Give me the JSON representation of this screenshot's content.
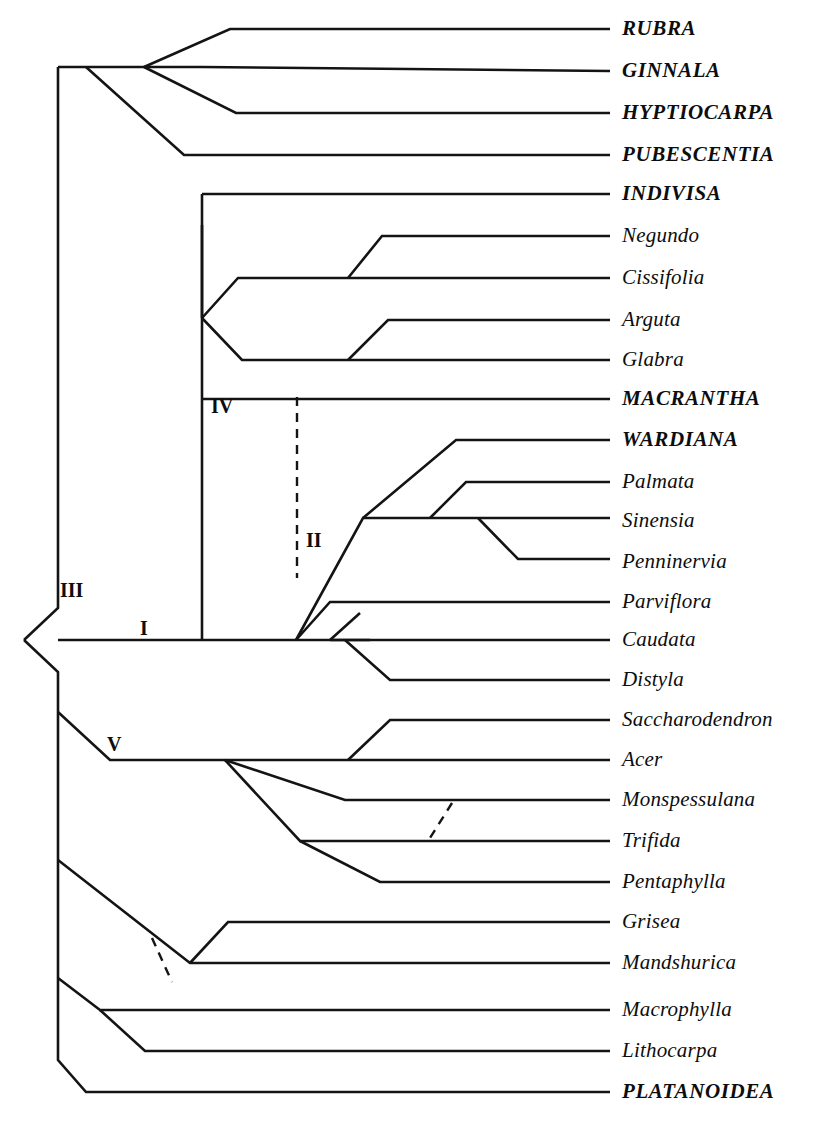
{
  "figure": {
    "kind": "cladogram",
    "title": "",
    "background_color": "#ffffff",
    "line_color": "#141414"
  },
  "tips": [
    {
      "label": "RUBRA",
      "style": "caps",
      "y": 29
    },
    {
      "label": "GINNALA",
      "style": "caps",
      "y": 71
    },
    {
      "label": "HYPTIOCARPA",
      "style": "caps",
      "y": 113
    },
    {
      "label": "PUBESCENTIA",
      "style": "caps",
      "y": 155
    },
    {
      "label": "INDIVISA",
      "style": "caps",
      "y": 194
    },
    {
      "label": "Negundo",
      "style": "lower",
      "y": 236
    },
    {
      "label": "Cissifolia",
      "style": "lower",
      "y": 278
    },
    {
      "label": "Arguta",
      "style": "lower",
      "y": 320
    },
    {
      "label": "Glabra",
      "style": "lower",
      "y": 360
    },
    {
      "label": "MACRANTHA",
      "style": "caps",
      "y": 399
    },
    {
      "label": "WARDIANA",
      "style": "caps",
      "y": 440
    },
    {
      "label": "Palmata",
      "style": "lower",
      "y": 482
    },
    {
      "label": "Sinensia",
      "style": "lower",
      "y": 521
    },
    {
      "label": "Penninervia",
      "style": "lower",
      "y": 562
    },
    {
      "label": "Parviflora",
      "style": "lower",
      "y": 602
    },
    {
      "label": "Caudata",
      "style": "lower",
      "y": 640
    },
    {
      "label": "Distyla",
      "style": "lower",
      "y": 680
    },
    {
      "label": "Saccharodendron",
      "style": "lower",
      "y": 720
    },
    {
      "label": "Acer",
      "style": "lower",
      "y": 760
    },
    {
      "label": "Monspessulana",
      "style": "lower",
      "y": 800
    },
    {
      "label": "Trifida",
      "style": "lower",
      "y": 841
    },
    {
      "label": "Pentaphylla",
      "style": "lower",
      "y": 882
    },
    {
      "label": "Grisea",
      "style": "lower",
      "y": 922
    },
    {
      "label": "Mandshurica",
      "style": "lower",
      "y": 963
    },
    {
      "label": "Macrophylla",
      "style": "lower",
      "y": 1010
    },
    {
      "label": "Lithocarpa",
      "style": "lower",
      "y": 1051
    },
    {
      "label": "PLATANOIDEA",
      "style": "caps",
      "y": 1092
    }
  ],
  "clade_marks": [
    {
      "label": "I",
      "x": 140,
      "y": 618
    },
    {
      "label": "II",
      "x": 306,
      "y": 530
    },
    {
      "label": "III",
      "x": 60,
      "y": 580
    },
    {
      "label": "IV",
      "x": 211,
      "y": 396
    },
    {
      "label": "V",
      "x": 107,
      "y": 734
    }
  ],
  "geometry": {
    "tip_line_end_x": 610,
    "label_left_x": 622,
    "root_x": 24,
    "root_y": 640,
    "notes": "branch paths are layout, drawn in svg template"
  }
}
